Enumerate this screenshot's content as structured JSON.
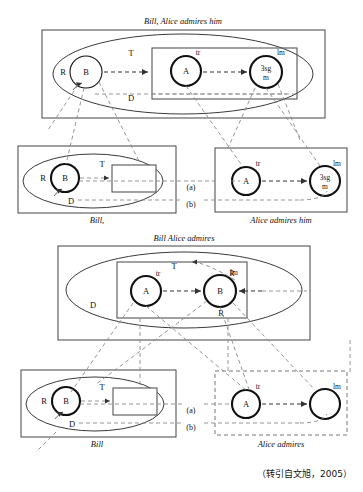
{
  "figure": {
    "citation": "（转引自文旭，2005）",
    "panels": [
      {
        "id": "upper",
        "title": "Bill, Alice admires him",
        "main_box": {
          "x": 42,
          "y": 30,
          "w": 283,
          "h": 88,
          "border": "solid"
        },
        "ellipse": {
          "cx": 183,
          "cy": 74,
          "rx": 130,
          "ry": 40
        },
        "inner_box": {
          "x": 152,
          "y": 48,
          "w": 145,
          "h": 51,
          "border": "solid"
        },
        "nodes": [
          {
            "name": "B",
            "label": "B",
            "cx": 86,
            "cy": 72,
            "r": 16,
            "weight": "thin",
            "tag": "R",
            "tag_x": 63,
            "tag_y": 75
          },
          {
            "name": "A",
            "label": "A",
            "cx": 186,
            "cy": 71,
            "r": 15,
            "weight": "bold",
            "tag": "tr",
            "tag_x": 198,
            "tag_y": 55
          },
          {
            "name": "3sgm",
            "label": "3sg m",
            "cx": 266,
            "cy": 72,
            "r": 16,
            "weight": "bold",
            "tag": "lm",
            "tag_x": 281,
            "tag_y": 55
          }
        ],
        "region_labels": [
          {
            "text": "T",
            "x": 131,
            "y": 56
          },
          {
            "text": "D",
            "x": 131,
            "y": 101
          }
        ]
      },
      {
        "id": "upper-left",
        "caption": "Bill,",
        "box": {
          "x": 18,
          "y": 146,
          "w": 158,
          "h": 67,
          "border": "solid"
        },
        "ellipse": {
          "cx": 93,
          "cy": 181,
          "rx": 70,
          "ry": 27
        },
        "nodes": [
          {
            "name": "B",
            "label": "B",
            "cx": 65,
            "cy": 178,
            "r": 14,
            "weight": "bold",
            "tag": "R",
            "tag_x": 43,
            "tag_y": 181
          }
        ],
        "empty_rect": {
          "x": 112,
          "y": 165,
          "w": 44,
          "h": 27
        },
        "region_labels": [
          {
            "text": "T",
            "x": 102,
            "y": 167
          },
          {
            "text": "D",
            "x": 71,
            "y": 204
          }
        ]
      },
      {
        "id": "upper-right",
        "caption": "Alice admires him",
        "box": {
          "x": 215,
          "y": 148,
          "w": 132,
          "h": 64,
          "border": "solid"
        },
        "nodes": [
          {
            "name": "A",
            "label": "A",
            "cx": 246,
            "cy": 181,
            "r": 14,
            "weight": "bold",
            "tag": "tr",
            "tag_x": 258,
            "tag_y": 166
          },
          {
            "name": "3sgm",
            "label": "3sg m",
            "cx": 325,
            "cy": 181,
            "r": 15,
            "weight": "bold",
            "tag": "lm",
            "tag_x": 337,
            "tag_y": 166
          }
        ]
      },
      {
        "id": "lower",
        "title": "Bill Alice admires",
        "main_box": {
          "x": 58,
          "y": 246,
          "w": 252,
          "h": 94,
          "border": "solid"
        },
        "ellipse": {
          "cx": 184,
          "cy": 290,
          "rx": 118,
          "ry": 38
        },
        "inner_box": {
          "x": 117,
          "y": 262,
          "w": 130,
          "h": 56,
          "border": "solid"
        },
        "nodes": [
          {
            "name": "A",
            "label": "A",
            "cx": 146,
            "cy": 291,
            "r": 15,
            "weight": "bold",
            "tag": "tr",
            "tag_x": 158,
            "tag_y": 276
          },
          {
            "name": "B",
            "label": "B",
            "cx": 220,
            "cy": 291,
            "r": 16,
            "weight": "bold",
            "tag": "lm",
            "tag_x": 232,
            "tag_y": 276,
            "tag2": "R",
            "tag2_x": 221,
            "tag2_y": 316
          }
        ],
        "region_labels": [
          {
            "text": "T",
            "x": 174,
            "y": 269
          },
          {
            "text": "D",
            "x": 93,
            "y": 308
          }
        ]
      },
      {
        "id": "lower-left",
        "caption": "Bill",
        "box": {
          "x": 21,
          "y": 370,
          "w": 155,
          "h": 67,
          "border": "solid"
        },
        "ellipse": {
          "cx": 95,
          "cy": 404,
          "rx": 69,
          "ry": 27
        },
        "nodes": [
          {
            "name": "B",
            "label": "B",
            "cx": 66,
            "cy": 401,
            "r": 14,
            "weight": "bold",
            "tag": "R",
            "tag_x": 44,
            "tag_y": 404
          }
        ],
        "empty_rect": {
          "x": 113,
          "y": 388,
          "w": 44,
          "h": 27
        },
        "region_labels": [
          {
            "text": "T",
            "x": 102,
            "y": 390
          },
          {
            "text": "D",
            "x": 72,
            "y": 427
          }
        ]
      },
      {
        "id": "lower-right",
        "caption": "Alice admires",
        "box": {
          "x": 215,
          "y": 371,
          "w": 132,
          "h": 64,
          "border": "dashed"
        },
        "nodes": [
          {
            "name": "A",
            "label": "A",
            "cx": 246,
            "cy": 404,
            "r": 14,
            "weight": "bold",
            "tag": "tr",
            "tag_x": 258,
            "tag_y": 389
          },
          {
            "name": "lm-empty",
            "label": "",
            "cx": 325,
            "cy": 404,
            "r": 15,
            "weight": "bold",
            "tag": "lm",
            "tag_x": 337,
            "tag_y": 389
          }
        ]
      }
    ],
    "correspondence_labels": [
      {
        "text": "(a)",
        "x": 191,
        "y": 190
      },
      {
        "text": "(b)",
        "x": 191,
        "y": 207
      },
      {
        "text": "(a)",
        "x": 191,
        "y": 413
      },
      {
        "text": "(b)",
        "x": 191,
        "y": 430
      }
    ]
  }
}
